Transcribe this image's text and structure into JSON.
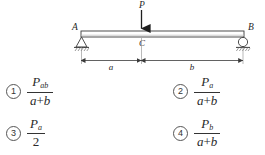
{
  "figure": {
    "beam_label_left": "A",
    "beam_label_right": "B",
    "beam_label_center": "C",
    "load_label": "P",
    "dimension_left": "a",
    "dimension_right": "b",
    "left_support": "pinned-support",
    "right_support": "roller-support",
    "load_direction": "down"
  },
  "options": [
    {
      "number": "1",
      "numerator_symbol": "P",
      "numerator_subscript": "ab",
      "denominator": "a + b",
      "denominator_left": "a",
      "denominator_op": "+",
      "denominator_right": "b"
    },
    {
      "number": "2",
      "numerator_symbol": "P",
      "numerator_subscript": "a",
      "denominator": "a + b",
      "denominator_left": "a",
      "denominator_op": "+",
      "denominator_right": "b"
    },
    {
      "number": "3",
      "numerator_symbol": "P",
      "numerator_subscript": "a",
      "denominator": "2",
      "denominator_left": "2",
      "denominator_op": "",
      "denominator_right": ""
    },
    {
      "number": "4",
      "numerator_symbol": "P",
      "numerator_subscript": "b",
      "denominator": "a + b",
      "denominator_left": "a",
      "denominator_op": "+",
      "denominator_right": "b"
    }
  ],
  "colors": {
    "ink": "#2a2a2a",
    "line": "#444444",
    "beam_fill": "#ffffff",
    "background": "#ffffff"
  }
}
